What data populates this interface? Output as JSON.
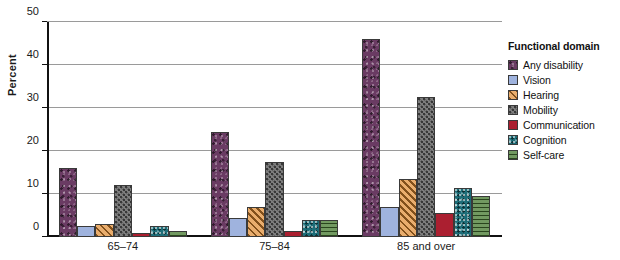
{
  "chart_data": {
    "type": "bar",
    "title": "",
    "xlabel": "",
    "ylabel": "Percent",
    "ylim": [
      0,
      50
    ],
    "yticks": [
      0,
      10,
      20,
      30,
      40,
      50
    ],
    "ytick_labels": [
      "0",
      "10",
      "20",
      "30",
      "40",
      "50"
    ],
    "grid": true,
    "legend_position": "right",
    "legend_title": "Functional domain",
    "categories": [
      "65–74",
      "75–84",
      "85 and over"
    ],
    "series": [
      {
        "name": "Any disability",
        "color": "#6a3b63",
        "pattern": "mottled",
        "values": [
          16.0,
          24.5,
          46.0
        ]
      },
      {
        "name": "Vision",
        "color": "#9fb3de",
        "pattern": "solid",
        "values": [
          2.5,
          4.5,
          7.0
        ]
      },
      {
        "name": "Hearing",
        "color": "#e08a2e",
        "pattern": "diagonal-stripes",
        "values": [
          3.0,
          7.0,
          13.5
        ]
      },
      {
        "name": "Mobility",
        "color": "#7d7d7d",
        "pattern": "dots",
        "values": [
          12.0,
          17.5,
          32.5
        ]
      },
      {
        "name": "Communication",
        "color": "#ab1f30",
        "pattern": "solid",
        "values": [
          1.0,
          1.5,
          5.5
        ]
      },
      {
        "name": "Cognition",
        "color": "#1d6d78",
        "pattern": "speckle",
        "values": [
          2.5,
          4.0,
          11.5
        ]
      },
      {
        "name": "Self-care",
        "color": "#4a7d35",
        "pattern": "horizontal-lines",
        "values": [
          1.5,
          4.0,
          9.5
        ]
      }
    ]
  }
}
